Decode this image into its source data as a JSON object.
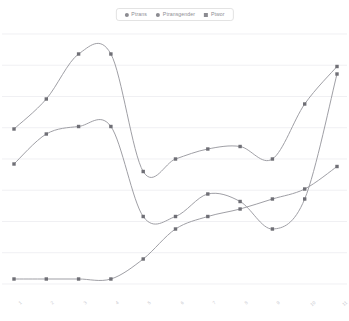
{
  "legend": {
    "position": "top-center",
    "items": [
      {
        "label": "Ptrans",
        "color": "#8b8b91",
        "marker": "circle"
      },
      {
        "label": "Ptransgender",
        "color": "#8b8b91",
        "marker": "circle"
      },
      {
        "label": "Ptwor",
        "color": "#8b8b91",
        "marker": "square"
      }
    ]
  },
  "chart_data": {
    "type": "line",
    "title": "",
    "subtitle": "",
    "xlabel": "",
    "ylabel": "",
    "grid": true,
    "gridlines": 9,
    "legend_position": "top-center",
    "xlim": [
      0,
      10
    ],
    "ylim": [
      0,
      1
    ],
    "interpolation": "spline",
    "markers": "square",
    "line_color": "#9a9aa0",
    "marker_color": "#6f6f76",
    "grid_color": "#ededf1",
    "x": [
      0,
      1,
      2,
      3,
      4,
      5,
      6,
      7,
      8,
      9,
      10
    ],
    "tick_labels": [
      "1",
      "2",
      "3",
      "4",
      "5",
      "6",
      "7",
      "8",
      "9",
      "10",
      "11"
    ],
    "series": [
      {
        "name": "Ptrans",
        "color": "#8b8b91",
        "values": [
          0.62,
          0.74,
          0.92,
          0.92,
          0.45,
          0.5,
          0.54,
          0.55,
          0.5,
          0.72,
          0.87
        ]
      },
      {
        "name": "Ptransgender",
        "color": "#8b8b91",
        "values": [
          0.48,
          0.6,
          0.63,
          0.63,
          0.27,
          0.27,
          0.36,
          0.33,
          0.22,
          0.34,
          0.84
        ]
      },
      {
        "name": "Ptwor",
        "color": "#8b8b91",
        "values": [
          0.02,
          0.02,
          0.02,
          0.02,
          0.1,
          0.22,
          0.27,
          0.3,
          0.34,
          0.38,
          0.47
        ]
      }
    ]
  }
}
